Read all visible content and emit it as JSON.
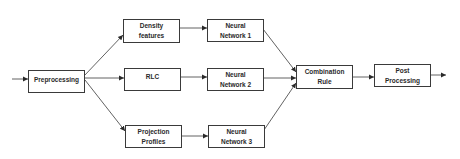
{
  "diagram": {
    "type": "flowchart",
    "direction": "left-to-right",
    "nodes": [
      {
        "id": "preprocessing",
        "label": "Preprocessing"
      },
      {
        "id": "density",
        "label": "Density\nfeatures"
      },
      {
        "id": "rlc",
        "label": "RLC"
      },
      {
        "id": "projection",
        "label": "Projection\nProfiles"
      },
      {
        "id": "nn1",
        "label": "Neural\nNetwork 1"
      },
      {
        "id": "nn2",
        "label": "Neural\nNetwork 2"
      },
      {
        "id": "nn3",
        "label": "Neural\nNetwork 3"
      },
      {
        "id": "combination",
        "label": "Combination\nRule"
      },
      {
        "id": "post",
        "label": "Post\nProcessing"
      }
    ],
    "edges": [
      [
        "input",
        "preprocessing"
      ],
      [
        "preprocessing",
        "density"
      ],
      [
        "preprocessing",
        "rlc"
      ],
      [
        "preprocessing",
        "projection"
      ],
      [
        "density",
        "nn1"
      ],
      [
        "rlc",
        "nn2"
      ],
      [
        "projection",
        "nn3"
      ],
      [
        "nn1",
        "combination"
      ],
      [
        "nn2",
        "combination"
      ],
      [
        "nn3",
        "combination"
      ],
      [
        "combination",
        "post"
      ],
      [
        "post",
        "output"
      ]
    ]
  }
}
